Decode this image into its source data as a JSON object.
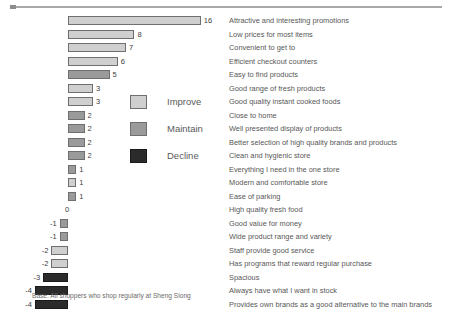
{
  "footnote": "Base: All shoppers who shop regularly at Sheng Siong",
  "legend": {
    "items": [
      {
        "label": "Improve",
        "key": "improve",
        "color": "#cfcfcf"
      },
      {
        "label": "Maintain",
        "key": "maintain",
        "color": "#9a9a9a"
      },
      {
        "label": "Decline",
        "key": "decline",
        "color": "#2b2b2b"
      }
    ]
  },
  "chart_data": {
    "type": "bar",
    "orientation": "horizontal",
    "title": "",
    "xlabel": "",
    "ylabel": "",
    "xlim": [
      -5,
      17
    ],
    "grid": false,
    "zero_baseline": 0,
    "legend_position": "center-left",
    "categories": [
      "Attractive and interesting promotions",
      "Low prices for most items",
      "Convenient to get to",
      "Efficient checkout counters",
      "Easy to find products",
      "Good range of fresh products",
      "Good quality instant cooked foods",
      "Close to home",
      "Well presented display of products",
      "Better selection of high quality brands and products",
      "Clean and hygienic store",
      "Everything I need in the one store",
      "Modern and comfortable store",
      "Ease of parking",
      "High quality fresh food",
      "Good value for money",
      "Wide product range and variety",
      "Staff provide good service",
      "Has programs that reward regular purchase",
      "Spacious",
      "Always have what I want in stock",
      "Provides own brands as a good alternative to the main brands"
    ],
    "values": [
      16,
      8,
      7,
      6,
      5,
      3,
      3,
      2,
      2,
      2,
      2,
      1,
      1,
      1,
      0,
      -1,
      -1,
      -2,
      -2,
      -3,
      -4,
      -4
    ],
    "value_labels": [
      "16",
      "8",
      "7",
      "6",
      "5",
      "3",
      "3",
      "2",
      "2",
      "2",
      "2",
      "1",
      "1",
      "1",
      "0",
      "-1",
      "-1",
      "-2",
      "-2",
      "-3",
      "-4",
      "-4"
    ],
    "series_groups": [
      "improve",
      "improve",
      "improve",
      "improve",
      "maintain",
      "improve",
      "improve",
      "maintain",
      "maintain",
      "maintain",
      "maintain",
      "maintain",
      "improve",
      "maintain",
      "none",
      "maintain",
      "maintain",
      "improve",
      "improve",
      "decline",
      "decline",
      "decline"
    ]
  }
}
